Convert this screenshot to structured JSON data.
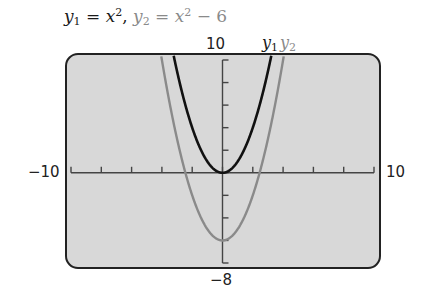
{
  "title": {
    "eq1_lhs": "y",
    "eq1_sub": "1",
    "eq1_rhs": " = x",
    "eq1_sup": "2",
    "sep": ",  ",
    "eq2_lhs": "y",
    "eq2_sub": "2",
    "eq2_rhs": " = x",
    "eq2_sup": "2",
    "eq2_tail": " − 6"
  },
  "labels": {
    "ymax": "10",
    "ymin": "−8",
    "xmin": "−10",
    "xmax": "10"
  },
  "legend": [
    {
      "name": "y",
      "sub": "1",
      "color": "#1a1a1a"
    },
    {
      "name": "y",
      "sub": "2",
      "color": "#8a8a8a"
    }
  ],
  "colors": {
    "screen_bg": "#d8d8d8",
    "frame": "#222222",
    "axis": "#444444",
    "y1": "#111111",
    "y2": "#8a8a8a"
  },
  "chart_data": {
    "type": "line",
    "xlabel": "",
    "ylabel": "",
    "xlim": [
      -10,
      10
    ],
    "ylim": [
      -8,
      10
    ],
    "xscale_tick": 2,
    "yscale_tick": 2,
    "grid": false,
    "legend_position": "top-right above window",
    "series": [
      {
        "name": "y1",
        "expression": "x^2",
        "color": "#111111",
        "x": [
          -3.16,
          -3,
          -2,
          -1,
          0,
          1,
          2,
          3,
          3.16
        ],
        "y": [
          10,
          9,
          4,
          1,
          0,
          1,
          4,
          9,
          10
        ]
      },
      {
        "name": "y2",
        "expression": "x^2 - 6",
        "color": "#8a8a8a",
        "x": [
          -4,
          -3,
          -2,
          -1,
          0,
          1,
          2,
          3,
          4
        ],
        "y": [
          10,
          3,
          -2,
          -5,
          -6,
          -5,
          -2,
          3,
          10
        ]
      }
    ]
  }
}
